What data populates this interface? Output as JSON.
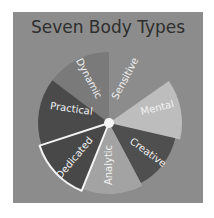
{
  "diagram": {
    "title": "Seven Body Types",
    "center": {
      "x": 109,
      "y": 123
    },
    "background_color": "#8c8c8c",
    "segments": [
      {
        "label": "Dynamic",
        "color": "#7a7a7a",
        "highlighted": false
      },
      {
        "label": "Sensitive",
        "color": "#8c8c8c",
        "highlighted": false
      },
      {
        "label": "Mental",
        "color": "#bdbdbd",
        "highlighted": false
      },
      {
        "label": "Creative",
        "color": "#4f4f4f",
        "highlighted": false
      },
      {
        "label": "Analytic",
        "color": "#a3a3a3",
        "highlighted": false
      },
      {
        "label": "Dedicated",
        "color": "#484848",
        "highlighted": true
      },
      {
        "label": "Practical",
        "color": "#4a4a4a",
        "highlighted": false
      }
    ]
  }
}
